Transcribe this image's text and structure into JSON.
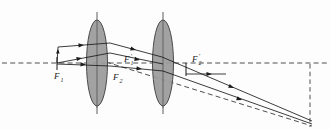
{
  "figure": {
    "kind": "optical-ray-diagram",
    "width": 330,
    "height": 129,
    "background_color": "#fdfdfd",
    "corner_mark": "",
    "axis": {
      "label": "optical-axis",
      "y": 63,
      "x_start": 2,
      "x_end": 328,
      "style": "dashed",
      "color": "#3a3a3a"
    },
    "colors": {
      "ray": "#1a1a1a",
      "lens_fill": "#9a9a9a",
      "lens_stroke": "#4a4a4a",
      "dashed": "#3a3a3a",
      "label": "#1a1a1a"
    },
    "lenses": [
      {
        "name": "objective-lens",
        "cx": 97,
        "cy": 63,
        "rx": 10.5,
        "ry": 43,
        "stem_top_y": 12,
        "stem_bottom_y": 114
      },
      {
        "name": "eyepiece-lens",
        "cx": 163,
        "cy": 63,
        "rx": 10.5,
        "ry": 43,
        "stem_top_y": 12,
        "stem_bottom_y": 114
      }
    ],
    "labels": [
      {
        "id": "F1",
        "base": "F",
        "prime": "",
        "sub": "1",
        "x": 59,
        "y": 77,
        "desc": "front-focal-point-lens-1"
      },
      {
        "id": "F1p",
        "base": "F",
        "prime": "′",
        "sub": "1",
        "x": 126,
        "y": 62,
        "desc": "back-focal-point-lens-1"
      },
      {
        "id": "F2",
        "base": "F",
        "prime": "",
        "sub": "2",
        "x": 115,
        "y": 80,
        "desc": "front-focal-point-lens-2"
      },
      {
        "id": "F2p",
        "base": "F",
        "prime": "′",
        "sub": "2",
        "x": 194,
        "y": 62,
        "desc": "back-focal-point-lens-2"
      }
    ],
    "rays": [
      {
        "name": "ray-upper-incoming",
        "points": "57,63 58,48 108,44",
        "arrows": [
          {
            "x": 80,
            "y": 46,
            "angle": -4
          }
        ]
      },
      {
        "name": "ray-upper-through-lens1",
        "points": "108,44 160,57",
        "arrows": [
          {
            "x": 132,
            "y": 50,
            "angle": 14
          }
        ]
      },
      {
        "name": "ray-mid-incoming",
        "points": "57,63 90,57 108,54",
        "arrows": [
          {
            "x": 74,
            "y": 60,
            "angle": -10
          }
        ]
      },
      {
        "name": "ray-mid-through-lens1",
        "points": "108,54 163,65",
        "arrows": [
          {
            "x": 137,
            "y": 60,
            "angle": 11
          }
        ]
      },
      {
        "name": "ray-lower-incoming",
        "points": "57,63 108,66",
        "arrows": [
          {
            "x": 82,
            "y": 64,
            "angle": 3
          }
        ]
      },
      {
        "name": "ray-lower-through-lens1",
        "points": "108,66 163,72",
        "arrows": [
          {
            "x": 138,
            "y": 69,
            "angle": 6
          }
        ]
      },
      {
        "name": "ray-out-upper",
        "points": "160,57 312,121",
        "arrows": [
          {
            "x": 232,
            "y": 87,
            "angle": 23
          }
        ]
      },
      {
        "name": "ray-out-lower",
        "points": "163,72 312,124",
        "arrows": [
          {
            "x": 238,
            "y": 98,
            "angle": 19
          }
        ]
      },
      {
        "name": "ray-axis-marker",
        "points": "186,74 226,74",
        "arrows": [
          {
            "x": 208,
            "y": 74,
            "angle": 0
          }
        ]
      }
    ],
    "dashed_constructions": [
      {
        "name": "dashed-diagonal-ray",
        "points": "108,63 312,126"
      },
      {
        "name": "dashed-vertical-right",
        "points": "310,64 310,127"
      },
      {
        "name": "dashed-axis-extension",
        "points": "186,63 328,63"
      }
    ],
    "tick_marks": [
      {
        "name": "tick-F1",
        "x": 57,
        "y1": 57,
        "y2": 69
      },
      {
        "name": "tick-F2p",
        "x": 186,
        "y1": 63,
        "y2": 75
      }
    ]
  }
}
